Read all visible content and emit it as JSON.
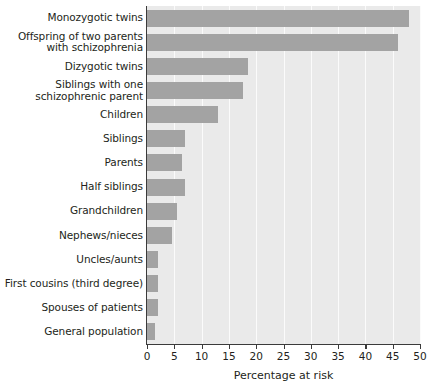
{
  "chart_data": {
    "type": "bar",
    "orientation": "horizontal",
    "title": "",
    "xlabel": "Percentage at risk",
    "ylabel": "",
    "xlim": [
      0,
      50
    ],
    "xticks": [
      0,
      5,
      10,
      15,
      20,
      25,
      30,
      35,
      40,
      45,
      50
    ],
    "grid": true,
    "legend": null,
    "bar_color": "#a3a3a3",
    "plot_background": "#eaeaea",
    "gridline_color": "#fbfbfb",
    "axis_color": "#3b3b3b",
    "categories": [
      "Monozygotic twins",
      "Offspring of two parents\nwith schizophrenia",
      "Dizygotic twins",
      "Siblings with one\nschizophrenic parent",
      "Children",
      "Siblings",
      "Parents",
      "Half siblings",
      "Grandchildren",
      "Nephews/nieces",
      "Uncles/aunts",
      "First cousins (third degree)",
      "Spouses of patients",
      "General population"
    ],
    "values": [
      48,
      46,
      18.5,
      17.5,
      13,
      7,
      6.5,
      7,
      5.5,
      4.5,
      2,
      2,
      2,
      1.5
    ]
  }
}
